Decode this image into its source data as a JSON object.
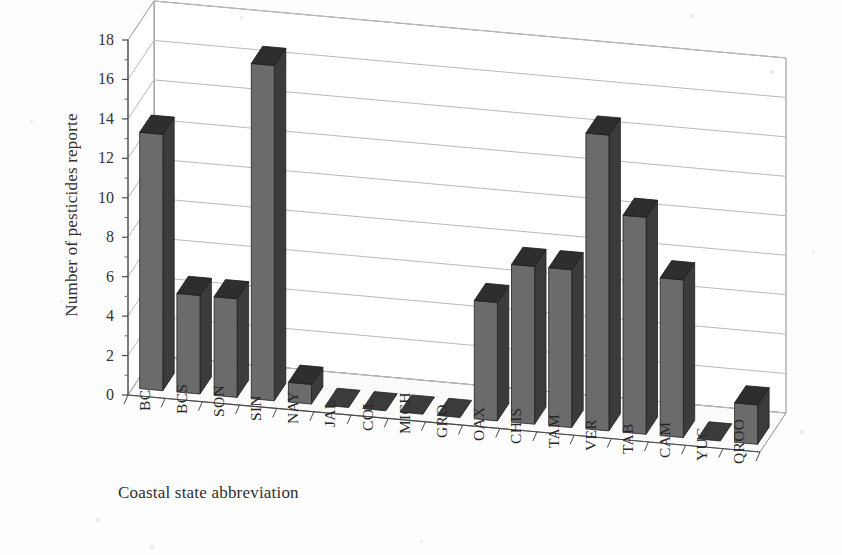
{
  "chart_data": {
    "type": "bar",
    "title": "",
    "subtitle": "",
    "xlabel": "Coastal state abbreviation",
    "ylabel": "Number of pesticides reporte",
    "categories": [
      "BC",
      "BCS",
      "SON",
      "SIN",
      "NAY",
      "JAL",
      "COL",
      "MICH",
      "GRO",
      "OAX",
      "CHIS",
      "TAM",
      "VER",
      "TAB",
      "CAM",
      "YUC",
      "QROO"
    ],
    "values": [
      13,
      5,
      5,
      17,
      1,
      0,
      0,
      0,
      0,
      6,
      8,
      8,
      15,
      11,
      8,
      0,
      2
    ],
    "ylim": [
      0,
      18
    ],
    "ytick_step": 2,
    "yticks": [
      "0",
      "2",
      "4",
      "6",
      "8",
      "10",
      "12",
      "14",
      "16",
      "18"
    ],
    "grid": true,
    "legend": "none",
    "three_d": true,
    "projection_note": "3D column chart, walls receding up-right",
    "colors": {
      "bar_front": "#6b6b6b",
      "bar_side": "#3b3b3b",
      "bar_top": "#2e2e2e",
      "grid_line": "#b9b9b9",
      "frame_line": "#8d8d8d",
      "floor": "#fbfbfb",
      "back_wall": "#ffffff",
      "text": "#2f2f2f",
      "background": "#fdfdfd"
    }
  }
}
